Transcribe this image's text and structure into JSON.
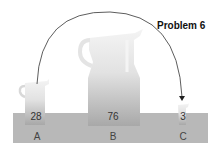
{
  "title": "Problem 6",
  "jugs": [
    {
      "label": "A",
      "value": "28"
    },
    {
      "label": "B",
      "value": "76"
    },
    {
      "label": "C",
      "value": "3"
    }
  ],
  "arrow": {
    "from": "A",
    "to": "C"
  }
}
